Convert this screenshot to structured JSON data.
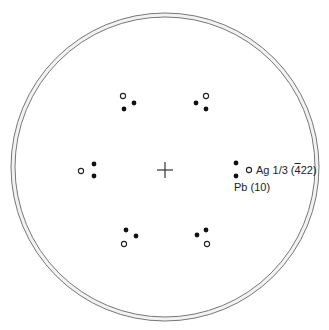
{
  "diagram": {
    "type": "diffraction-pattern",
    "center": {
      "x": 165,
      "y": 170,
      "marker": "cross",
      "arm": 8
    },
    "outer_ring": {
      "cx": 165,
      "cy": 167,
      "r_outer": 154,
      "r_inner": 150,
      "stroke": "#777777",
      "fill": "#f2f2f2"
    },
    "spot_colors": {
      "filled": "#111111",
      "open_stroke": "#222222"
    },
    "groups": [
      {
        "name": "top-left",
        "spots": [
          {
            "x": 123,
            "y": 96,
            "kind": "open"
          },
          {
            "x": 134,
            "y": 103,
            "kind": "filled"
          },
          {
            "x": 124,
            "y": 109,
            "kind": "filled"
          }
        ]
      },
      {
        "name": "top-right",
        "spots": [
          {
            "x": 206,
            "y": 96,
            "kind": "open"
          },
          {
            "x": 196,
            "y": 103,
            "kind": "filled"
          },
          {
            "x": 206,
            "y": 109,
            "kind": "filled"
          }
        ]
      },
      {
        "name": "left",
        "spots": [
          {
            "x": 81,
            "y": 171,
            "kind": "open"
          },
          {
            "x": 94,
            "y": 164,
            "kind": "filled"
          },
          {
            "x": 94,
            "y": 176,
            "kind": "filled"
          }
        ]
      },
      {
        "name": "right",
        "spots": [
          {
            "x": 236,
            "y": 163,
            "kind": "filled"
          },
          {
            "x": 249,
            "y": 170,
            "kind": "open"
          },
          {
            "x": 236,
            "y": 176,
            "kind": "filled"
          }
        ]
      },
      {
        "name": "bottom-left",
        "spots": [
          {
            "x": 126,
            "y": 230,
            "kind": "filled"
          },
          {
            "x": 136,
            "y": 236,
            "kind": "filled"
          },
          {
            "x": 124,
            "y": 244,
            "kind": "open"
          }
        ]
      },
      {
        "name": "bottom-right",
        "spots": [
          {
            "x": 206,
            "y": 230,
            "kind": "filled"
          },
          {
            "x": 197,
            "y": 235,
            "kind": "filled"
          },
          {
            "x": 207,
            "y": 244,
            "kind": "open"
          }
        ]
      }
    ],
    "labels": {
      "ag": {
        "prefix": "Ag  1/3 (",
        "overbar_digit": "4",
        "suffix": "22)",
        "x": 256,
        "y": 164
      },
      "pb": {
        "text": "Pb  (10)",
        "x": 234,
        "y": 181
      }
    }
  }
}
